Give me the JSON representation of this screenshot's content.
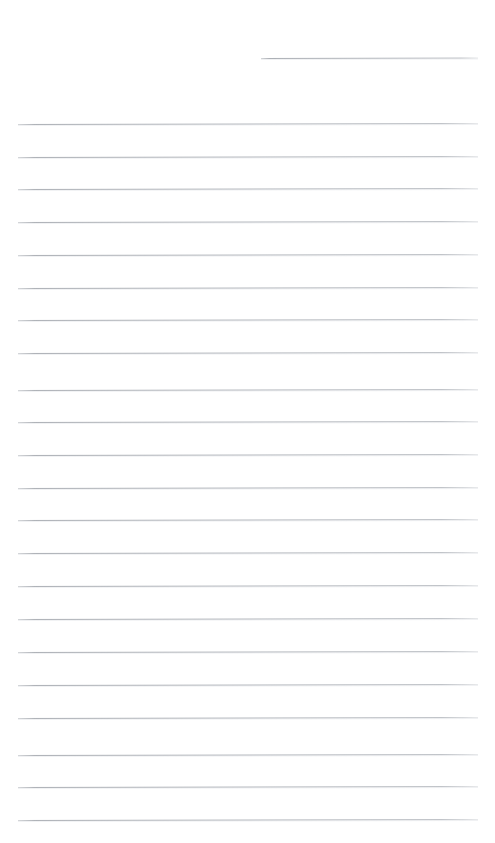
{
  "document": {
    "kind": "ruled-paper-scan",
    "title": "Blank ruled notepad page",
    "page_width": 495,
    "page_height": 843,
    "background_color": "#ffffff",
    "rule_color": "#acb0b6",
    "rule_thickness": 1,
    "rule_spacing": 32.6,
    "rule_left": 18,
    "rule_right": 478,
    "skew_degrees": -0.13,
    "text_content": "",
    "handwriting": "none",
    "rules": [
      {
        "id": "rule-partial-top",
        "type": "partial",
        "left": 261,
        "right": 478,
        "y": 58
      },
      {
        "id": "rule-1",
        "type": "full",
        "left": 18,
        "right": 478,
        "y": 124
      },
      {
        "id": "rule-2",
        "type": "full",
        "left": 18,
        "right": 478,
        "y": 157
      },
      {
        "id": "rule-3",
        "type": "full",
        "left": 18,
        "right": 478,
        "y": 189
      },
      {
        "id": "rule-4",
        "type": "full",
        "left": 18,
        "right": 478,
        "y": 222
      },
      {
        "id": "rule-5",
        "type": "full",
        "left": 18,
        "right": 478,
        "y": 255
      },
      {
        "id": "rule-6",
        "type": "full",
        "left": 18,
        "right": 478,
        "y": 288
      },
      {
        "id": "rule-7",
        "type": "full",
        "left": 18,
        "right": 478,
        "y": 320
      },
      {
        "id": "rule-8",
        "type": "full",
        "left": 18,
        "right": 478,
        "y": 353
      },
      {
        "id": "rule-9",
        "type": "full",
        "left": 18,
        "right": 478,
        "y": 390
      },
      {
        "id": "rule-10",
        "type": "full",
        "left": 18,
        "right": 478,
        "y": 422
      },
      {
        "id": "rule-11",
        "type": "full",
        "left": 18,
        "right": 478,
        "y": 455
      },
      {
        "id": "rule-12",
        "type": "full",
        "left": 18,
        "right": 478,
        "y": 488
      },
      {
        "id": "rule-13",
        "type": "full",
        "left": 18,
        "right": 478,
        "y": 520
      },
      {
        "id": "rule-14",
        "type": "full",
        "left": 18,
        "right": 478,
        "y": 553
      },
      {
        "id": "rule-15",
        "type": "full",
        "left": 18,
        "right": 478,
        "y": 586
      },
      {
        "id": "rule-16",
        "type": "full",
        "left": 18,
        "right": 478,
        "y": 619
      },
      {
        "id": "rule-17",
        "type": "full",
        "left": 18,
        "right": 478,
        "y": 652
      },
      {
        "id": "rule-18",
        "type": "full",
        "left": 18,
        "right": 478,
        "y": 685
      },
      {
        "id": "rule-19",
        "type": "full",
        "left": 18,
        "right": 478,
        "y": 718
      },
      {
        "id": "rule-20",
        "type": "full",
        "left": 18,
        "right": 478,
        "y": 755
      },
      {
        "id": "rule-21",
        "type": "full",
        "left": 18,
        "right": 478,
        "y": 787
      },
      {
        "id": "rule-22",
        "type": "full",
        "left": 18,
        "right": 478,
        "y": 820
      }
    ]
  }
}
